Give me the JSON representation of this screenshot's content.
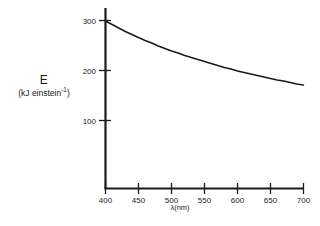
{
  "chart_data": {
    "type": "line",
    "title": "",
    "subtitle": "",
    "xlabel": "λ(nm)",
    "ylabel": "E",
    "ylabel_units": "(kJ einstein",
    "ylabel_units_exponent": "-1",
    "ylabel_units_close": ")",
    "xlim": [
      400,
      700
    ],
    "ylim": [
      0,
      320
    ],
    "xticks": [
      400,
      450,
      500,
      550,
      600,
      650,
      700
    ],
    "xticklabels": [
      "400",
      "450",
      "500",
      "550",
      "600",
      "650",
      "700"
    ],
    "yticks": [
      100,
      200,
      300
    ],
    "yticklabels": [
      "100",
      "200",
      "300"
    ],
    "grid": false,
    "legend": null,
    "series": [
      {
        "name": "Photon energy per einstein",
        "x": [
          400,
          410,
          420,
          430,
          440,
          450,
          460,
          470,
          480,
          490,
          500,
          510,
          520,
          530,
          540,
          550,
          560,
          570,
          580,
          590,
          600,
          610,
          620,
          630,
          640,
          650,
          660,
          670,
          680,
          690,
          700
        ],
        "y": [
          299,
          292,
          285,
          278,
          272,
          266,
          260,
          255,
          249,
          244,
          239,
          235,
          230,
          226,
          222,
          218,
          214,
          210,
          206,
          203,
          199,
          196,
          193,
          190,
          187,
          184,
          181,
          179,
          176,
          173,
          171
        ]
      }
    ],
    "curve_color": "#1a1a1a",
    "axis_color": "#1a1a1a",
    "background_color": "#ffffff"
  }
}
